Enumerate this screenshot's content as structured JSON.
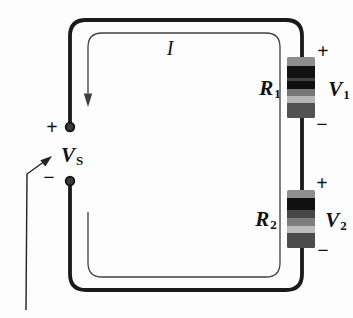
{
  "figure": {
    "type": "series-circuit-diagram",
    "current": {
      "label": "I"
    },
    "source": {
      "plus": "+",
      "minus": "−",
      "symbol": "V",
      "subscript": "S"
    },
    "resistor1": {
      "symbol": "R",
      "subscript": "1",
      "voltage": {
        "plus": "+",
        "symbol": "V",
        "subscript": "1",
        "minus": "−"
      }
    },
    "resistor2": {
      "symbol": "R",
      "subscript": "2",
      "voltage": {
        "plus": "+",
        "symbol": "V",
        "subscript": "2",
        "minus": "−"
      }
    },
    "colors": {
      "wire": "#1a1a1a",
      "current_loop": "#3f3f3f",
      "text": "#111111",
      "background": "#fdfdfd",
      "resistor_bands_r1": [
        "#8e8e8e",
        "#121212",
        "#424242",
        "#0f0f0f",
        "#767676",
        "#b6b6b6",
        "#525252"
      ],
      "resistor_bands_r2": [
        "#8e8e8e",
        "#101010",
        "#474747",
        "#7d7d7d",
        "#bcbcbc",
        "#4c4c4c"
      ]
    }
  }
}
